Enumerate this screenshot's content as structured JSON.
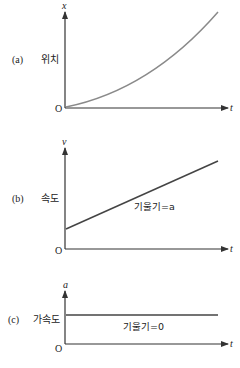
{
  "colors": {
    "axis": "#333333",
    "curve": "#8a8a8a",
    "text": "#222222"
  },
  "panels": [
    {
      "label": "(a)",
      "quantity": "위치",
      "axis_y": "x",
      "axis_x": "t",
      "origin": "O",
      "curve_type": "quadratic"
    },
    {
      "label": "(b)",
      "quantity": "속도",
      "axis_y": "v",
      "axis_x": "t",
      "origin": "O",
      "curve_type": "linear",
      "annotation": "기울기=a"
    },
    {
      "label": "(c)",
      "quantity": "가속도",
      "axis_y": "a",
      "axis_x": "t",
      "origin": "O",
      "curve_type": "constant",
      "annotation": "기울기=0"
    }
  ]
}
